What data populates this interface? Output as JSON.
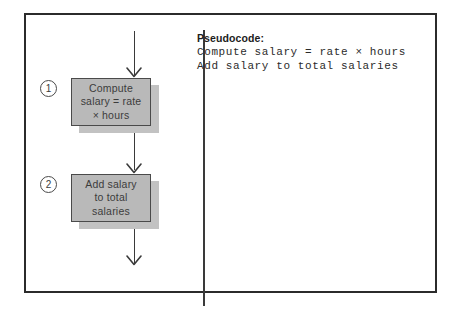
{
  "figure": {
    "type": "flowchart-with-pseudocode",
    "panels": {
      "left": "flowchart",
      "right": "pseudocode"
    }
  },
  "flowchart": {
    "steps": [
      {
        "marker": "1",
        "label": "Compute\nsalary = rate\n× hours"
      },
      {
        "marker": "2",
        "label": "Add salary\nto total\nsalaries"
      }
    ],
    "connectors": [
      {
        "name": "entry-arrow"
      },
      {
        "name": "between-steps-arrow"
      },
      {
        "name": "exit-arrow"
      }
    ]
  },
  "pseudocode": {
    "heading": "Pseudocode:",
    "lines": [
      "Compute salary = rate × hours",
      "Add salary to total salaries"
    ]
  },
  "colors": {
    "box_fill": "#b9b9b9",
    "box_border": "#4a4a4a",
    "box_shadow": "#c2c2c2",
    "frame_border": "#2b2b2b",
    "line": "#3a3a3a",
    "text": "#3c3c3c"
  }
}
